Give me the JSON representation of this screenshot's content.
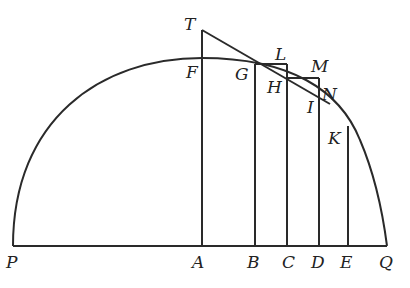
{
  "diagram": {
    "type": "geometry",
    "labels": {
      "T": "T",
      "F": "F",
      "G": "G",
      "L": "L",
      "H": "H",
      "M": "M",
      "N": "N",
      "I": "I",
      "K": "K",
      "P": "P",
      "A": "A",
      "B": "B",
      "C": "C",
      "D": "D",
      "E": "E",
      "Q": "Q"
    },
    "points": {
      "P": [
        13,
        246
      ],
      "Q": [
        387,
        246
      ],
      "A": [
        202,
        246
      ],
      "B": [
        255,
        246
      ],
      "C": [
        287,
        246
      ],
      "D": [
        319,
        246
      ],
      "E": [
        348,
        246
      ],
      "T": [
        202,
        30
      ],
      "F": [
        202,
        58
      ],
      "L_corner": [
        287,
        64
      ],
      "G_top": [
        255,
        64
      ],
      "H": [
        287,
        78
      ],
      "M_corner": [
        319,
        78
      ],
      "N": [
        319,
        97
      ]
    },
    "colors": {
      "stroke": "#2a2a2a",
      "background": "#ffffff"
    }
  }
}
